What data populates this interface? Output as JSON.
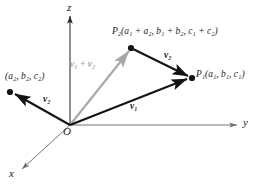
{
  "figure": {
    "background_color": "#ffffff",
    "colors": {
      "vector_black": "#141414",
      "resultant_gray": "#a8a8a8",
      "axis_gray": "#6e6e6e",
      "axis_dark": "#1a1a1a",
      "text": "#1a1a1a"
    },
    "axes": [
      {
        "name": "z-axis",
        "label": "z",
        "label_x": 67,
        "label_y": 3,
        "direction": "up"
      },
      {
        "name": "y-axis",
        "label": "y",
        "label_x": 243,
        "label_y": 117,
        "direction": "right"
      },
      {
        "name": "x-axis",
        "label": "x",
        "label_x": 10,
        "label_y": 170,
        "direction": "down-left"
      }
    ],
    "origin": {
      "label": "O",
      "label_x": 64,
      "label_y": 127,
      "x": 70,
      "y": 125
    },
    "points": [
      {
        "name": "point-p1",
        "label_prefix": "P",
        "label_sub": "1",
        "label_coords": "(a₁, b₁, c₁)",
        "label_text": "P₁(a₁, b₁, c₁)",
        "label_x": 196,
        "label_y": 71,
        "dot_x": 192,
        "dot_y": 78
      },
      {
        "name": "point-p2",
        "label_prefix": "P",
        "label_sub": "2",
        "label_coords": "(a₁ + a₂, b₁ + b₂, c₁ + c₂)",
        "label_text": "P₂(a₁ + a₂, b₁ + b₂, c₁ + c₂)",
        "label_x": 112,
        "label_y": 28,
        "dot_x": 131,
        "dot_y": 48
      },
      {
        "name": "point-a2b2c2",
        "label_prefix": "",
        "label_sub": "",
        "label_coords": "(a₂, b₂, c₂)",
        "label_text": "(a₂, b₂, c₂)",
        "label_x": 6,
        "label_y": 74,
        "dot_x": 10,
        "dot_y": 92
      }
    ],
    "vectors": [
      {
        "name": "vector-v1-origin-to-p1",
        "label": "v₁",
        "label_base": "v",
        "label_sub": "1",
        "label_x": 131,
        "label_y": 103,
        "color": "#141414",
        "from": {
          "x": 70,
          "y": 125
        },
        "to": {
          "x": 189,
          "y": 79
        }
      },
      {
        "name": "vector-v2-p2-to-p1",
        "label": "v₂",
        "label_base": "v",
        "label_sub": "2",
        "label_x": 165,
        "label_y": 52,
        "color": "#141414",
        "from": {
          "x": 134,
          "y": 49
        },
        "to": {
          "x": 189,
          "y": 76
        }
      },
      {
        "name": "vector-v2-origin-to-a2b2c2",
        "label": "v₂",
        "label_base": "v",
        "label_sub": "2",
        "label_x": 44,
        "label_y": 96,
        "color": "#141414",
        "from": {
          "x": 70,
          "y": 125
        },
        "to": {
          "x": 13,
          "y": 93
        }
      },
      {
        "name": "vector-resultant-v1-plus-v2",
        "label": "v₁ + v₂",
        "label_base": "v",
        "label_sub": "1",
        "label_op": " + ",
        "label_base2": "v",
        "label_sub2": "2",
        "label_x": 71,
        "label_y": 61,
        "color": "#a8a8a8",
        "from": {
          "x": 70,
          "y": 125
        },
        "to": {
          "x": 129,
          "y": 50
        }
      }
    ]
  }
}
